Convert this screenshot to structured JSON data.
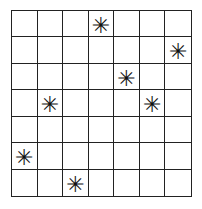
{
  "grid": {
    "rows": 7,
    "cols": 7,
    "marker_symbol": "✳",
    "cells": [
      [
        "",
        "",
        "",
        "✳",
        "",
        "",
        ""
      ],
      [
        "",
        "",
        "",
        "",
        "",
        "",
        "✳"
      ],
      [
        "",
        "",
        "",
        "",
        "✳",
        "",
        ""
      ],
      [
        "",
        "✳",
        "",
        "",
        "",
        "✳",
        ""
      ],
      [
        "",
        "",
        "",
        "",
        "",
        "",
        ""
      ],
      [
        "✳",
        "",
        "",
        "",
        "",
        "",
        ""
      ],
      [
        "",
        "",
        "✳",
        "",
        "",
        "",
        ""
      ]
    ],
    "marked_positions": [
      [
        0,
        3
      ],
      [
        1,
        6
      ],
      [
        2,
        4
      ],
      [
        3,
        1
      ],
      [
        3,
        5
      ],
      [
        5,
        0
      ],
      [
        6,
        2
      ]
    ]
  }
}
